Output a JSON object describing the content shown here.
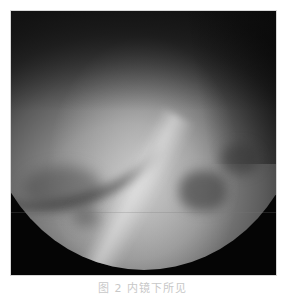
{
  "figure": {
    "image_description": "Grayscale endoscopic view showing circular scope field with mucosal folds and triangular recesses",
    "background_color": "#050505",
    "caption": "图 2   内镜下所见"
  }
}
